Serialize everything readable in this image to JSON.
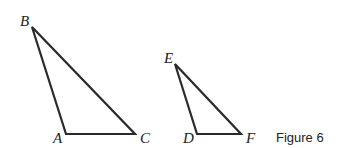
{
  "figure": {
    "caption": "Figure 6",
    "stroke_color": "#2a2a2a",
    "triangles": [
      {
        "name": "ABC",
        "vertices": {
          "A": {
            "label": "A",
            "x": 66,
            "y": 134
          },
          "B": {
            "label": "B",
            "x": 32,
            "y": 27
          },
          "C": {
            "label": "C",
            "x": 135,
            "y": 134
          }
        }
      },
      {
        "name": "DEF",
        "vertices": {
          "D": {
            "label": "D",
            "x": 197,
            "y": 134
          },
          "E": {
            "label": "E",
            "x": 175,
            "y": 64
          },
          "F": {
            "label": "F",
            "x": 241,
            "y": 134
          }
        }
      }
    ]
  }
}
